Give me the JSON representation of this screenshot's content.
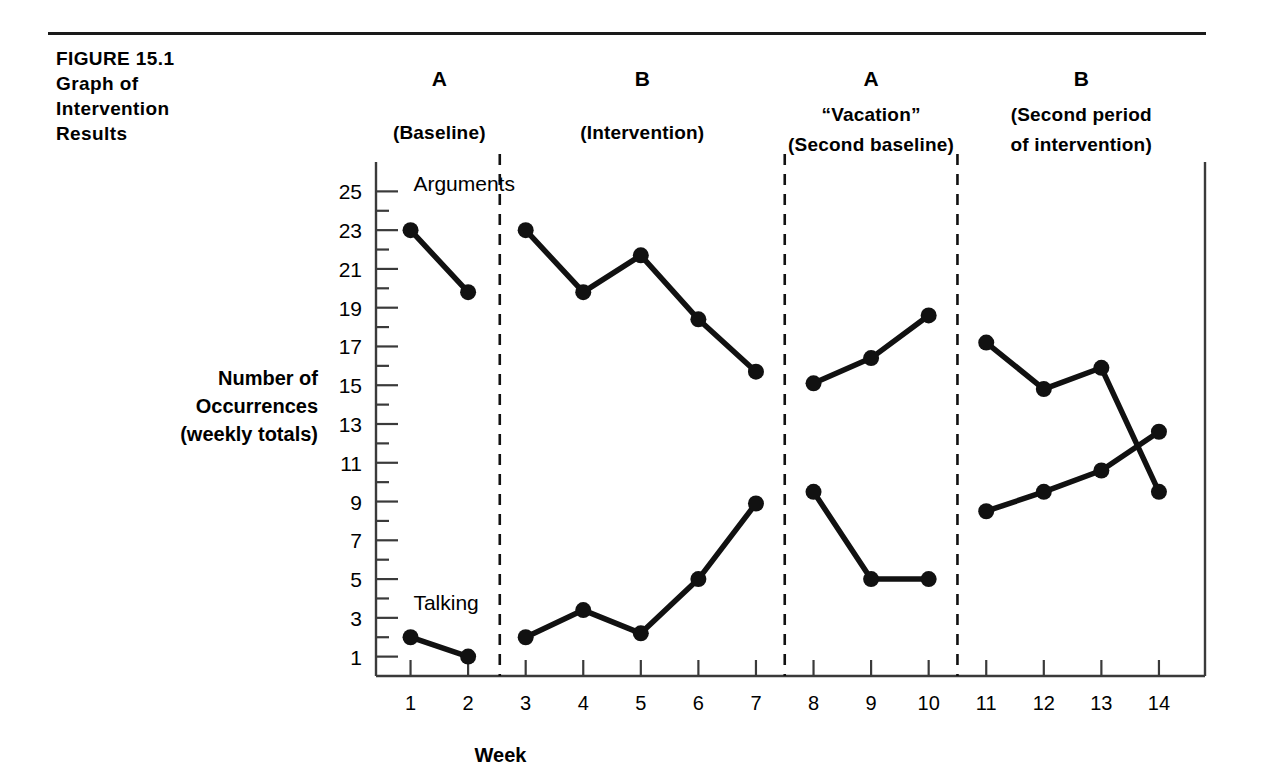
{
  "figure": {
    "caption_lines": [
      "FIGURE 15.1",
      "Graph of",
      "Intervention",
      "Results"
    ]
  },
  "chart_data": {
    "type": "line",
    "title": "Graph of Intervention Results",
    "xlabel": "Week",
    "ylabel": "Number of Occurrences (weekly totals)",
    "ylabel_lines": [
      "Number of",
      "Occurrences",
      "(weekly totals)"
    ],
    "x": [
      1,
      2,
      3,
      4,
      5,
      6,
      7,
      8,
      9,
      10,
      11,
      12,
      13,
      14
    ],
    "xtick_labels": [
      "1",
      "2",
      "3",
      "4",
      "5",
      "6",
      "7",
      "8",
      "9",
      "10",
      "11",
      "12",
      "13",
      "14"
    ],
    "ytick_labels": [
      "1",
      "3",
      "5",
      "7",
      "9",
      "11",
      "13",
      "15",
      "17",
      "19",
      "21",
      "23",
      "25"
    ],
    "ytick_values": [
      1,
      3,
      5,
      7,
      9,
      11,
      13,
      15,
      17,
      19,
      21,
      23,
      25
    ],
    "ylim": [
      0,
      26
    ],
    "xlim": [
      0.4,
      14.8
    ],
    "grid": false,
    "minor_ticks": true,
    "legend": "inline-labels",
    "series": [
      {
        "name": "Arguments",
        "label": "Arguments",
        "label_x": 1.05,
        "label_y": 25.0,
        "color": "#111111",
        "segments": [
          {
            "x": [
              1,
              2
            ],
            "values": [
              23.0,
              19.8
            ]
          },
          {
            "x": [
              3,
              4,
              5,
              6,
              7
            ],
            "values": [
              23.0,
              19.8,
              21.7,
              18.4,
              15.7
            ]
          },
          {
            "x": [
              8,
              9,
              10
            ],
            "values": [
              15.1,
              16.4,
              18.6
            ]
          },
          {
            "x": [
              11,
              12,
              13,
              14
            ],
            "values": [
              17.2,
              14.8,
              15.9,
              9.5
            ]
          }
        ]
      },
      {
        "name": "Talking",
        "label": "Talking",
        "label_x": 1.05,
        "label_y": 3.4,
        "color": "#111111",
        "segments": [
          {
            "x": [
              1,
              2
            ],
            "values": [
              2.0,
              1.0
            ]
          },
          {
            "x": [
              3,
              4,
              5,
              6,
              7
            ],
            "values": [
              2.0,
              3.4,
              2.2,
              5.0,
              8.9
            ]
          },
          {
            "x": [
              8,
              9,
              10
            ],
            "values": [
              9.5,
              5.0,
              5.0
            ]
          },
          {
            "x": [
              11,
              12,
              13,
              14
            ],
            "values": [
              8.5,
              9.5,
              10.6,
              12.6
            ]
          }
        ]
      }
    ],
    "phases": [
      {
        "letter": "A",
        "lines": [
          "(Baseline)"
        ],
        "x_start": 0.45,
        "x_end": 2.55
      },
      {
        "letter": "B",
        "lines": [
          "(Intervention)"
        ],
        "x_start": 2.55,
        "x_end": 7.5
      },
      {
        "letter": "A",
        "lines": [
          "“Vacation”",
          "(Second baseline)"
        ],
        "x_start": 7.5,
        "x_end": 10.5
      },
      {
        "letter": "B",
        "lines": [
          "(Second period",
          "of intervention)"
        ],
        "x_start": 10.5,
        "x_end": 14.8
      }
    ],
    "dividers": [
      2.55,
      7.5,
      10.5
    ],
    "annotations": []
  }
}
